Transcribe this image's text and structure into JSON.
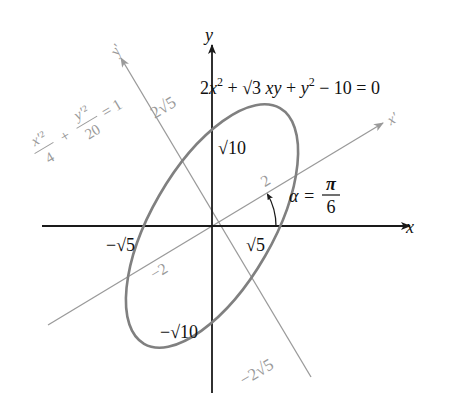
{
  "diagram": {
    "colors": {
      "axes": "#1a1a1a",
      "rotated_axes": "#9a9a9a",
      "ellipse": "#808080",
      "label_dark": "#111111",
      "label_gray": "#9a9a9a"
    },
    "origin": [
      212,
      226
    ],
    "unit_px": 30.5,
    "rotation_deg": 30,
    "ellipse": {
      "semi_axis_xprime": 2,
      "semi_axis_yprime": 4.472
    },
    "axes": {
      "x_label": "x",
      "y_label": "y",
      "xprime_label": "x′",
      "yprime_label": "y′"
    },
    "equations": {
      "original": "2x² + √3 xy + y² − 10 = 0",
      "rotated_num1": "x′²",
      "rotated_den1": "4",
      "rotated_plus": "+",
      "rotated_num2": "y′²",
      "rotated_den2": "20",
      "rotated_rhs": "= 1"
    },
    "angle": {
      "lhs": "α =",
      "num": "π",
      "den": "6"
    },
    "intercepts": {
      "x_pos": "√5",
      "x_neg": "−√5",
      "y_pos": "√10",
      "y_neg": "−√10",
      "xprime_pos": "2",
      "xprime_neg": "−2",
      "yprime_pos": "2√5",
      "yprime_neg": "−2√5"
    }
  }
}
